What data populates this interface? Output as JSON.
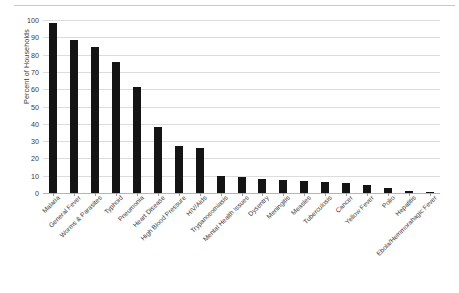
{
  "chart_data": {
    "type": "bar",
    "title": "",
    "subtitle": "",
    "xlabel": "",
    "ylabel": "Percent of Households",
    "ylim": [
      0,
      100
    ],
    "yticks": [
      0,
      10,
      20,
      30,
      40,
      50,
      60,
      70,
      80,
      90,
      100
    ],
    "grid": true,
    "legend": false,
    "legend_position": "none",
    "bar_color": "#141414",
    "categories": [
      "Malaria",
      "General Fever",
      "Worms & Parasites",
      "Typhoid",
      "Pneumonia",
      "Heart Disease",
      "High Blood Pressure",
      "HIV/Aids",
      "Trypanosomiasis",
      "Mental Health Issues",
      "Dysentry",
      "Meningitis",
      "Measles",
      "Tuberculosis",
      "Cancer",
      "Yellow Fever",
      "Polio",
      "Hepatitis",
      "Ebola/Hemmorahagic Fever"
    ],
    "values": [
      98,
      88.5,
      84.5,
      75.5,
      61,
      38,
      27,
      26,
      10,
      9,
      8,
      7.5,
      7,
      6.5,
      6,
      4.5,
      3,
      1,
      0.7
    ]
  },
  "axis": {
    "y_title": "Percent of Households"
  }
}
